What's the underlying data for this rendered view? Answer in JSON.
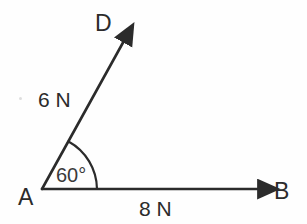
{
  "figure": {
    "type": "force-vector-diagram",
    "background_color": "#fefefe",
    "stroke_color": "#2b2b2b",
    "vertex_label": "A",
    "vertex_point": {
      "x": 42,
      "y": 189
    },
    "vectors": [
      {
        "id": "AD",
        "label": "D",
        "magnitude_label": "6 N",
        "from": "A",
        "to": "D",
        "tip": {
          "x": 130,
          "y": 30
        },
        "angle_from_horizontal_deg": 61
      },
      {
        "id": "AB",
        "label": "B",
        "magnitude_label": "8 N",
        "from": "A",
        "to": "B",
        "tip": {
          "x": 269,
          "y": 189
        },
        "angle_from_horizontal_deg": 0
      }
    ],
    "angle": {
      "value": "60°",
      "between": [
        "AD",
        "AB"
      ],
      "arc_radius": 55
    }
  },
  "labels": {
    "point_a": "A",
    "point_b": "B",
    "point_d": "D",
    "force_ad": "6 N",
    "force_ab": "8 N",
    "angle_value": "60°"
  }
}
